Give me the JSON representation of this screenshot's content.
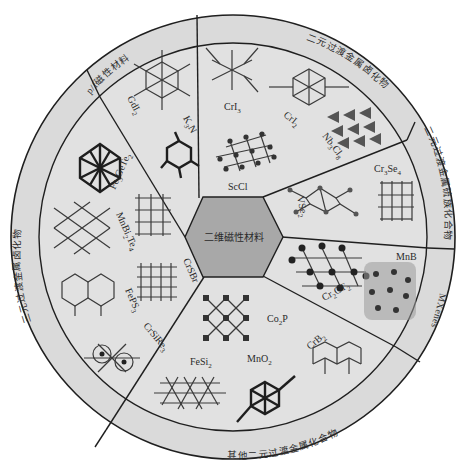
{
  "title": "二维磁性材料",
  "colors": {
    "ring": "#d9d9d9",
    "inner": "#dcdcdc",
    "hexagon": "#a9a9a9",
    "line": "#1f1f1f",
    "background": "#ffffff"
  },
  "categories": [
    {
      "id": "p-orbital",
      "label": "p/f磁性材料"
    },
    {
      "id": "binary-halides",
      "label": "二元过渡金属卤化物"
    },
    {
      "id": "binary-chalcogenides",
      "label": "二元过渡金属硫族化合物"
    },
    {
      "id": "mxenes",
      "label": "MXenes"
    },
    {
      "id": "other-binary",
      "label": "其他二元过渡金属化合物"
    },
    {
      "id": "ternary-halides",
      "label": "三元过渡金属卤化物"
    }
  ],
  "materials": {
    "p_orbital": [
      "GdI2",
      "K3N"
    ],
    "binary_halides": [
      "CrI3",
      "CrI2",
      "Nb3Cl8",
      "ScCl"
    ],
    "binary_chalcogenides": [
      "VSe2",
      "Cr3Se4"
    ],
    "mxenes": [
      "MnB",
      "Cr2CT2"
    ],
    "other_binary": [
      "Co2P",
      "CrB2",
      "MnO2",
      "FeSi2"
    ],
    "ternary_halides": [
      "Fe3GeTe2",
      "MnBi2Te4",
      "CrSBr",
      "FePS3",
      "CrSiRe3"
    ]
  },
  "labels": {
    "GdI2": {
      "base": "GdI",
      "sub": "2"
    },
    "K3N": {
      "base": "K",
      "sub": "3",
      "tail": "N"
    },
    "CrI3": {
      "base": "CrI",
      "sub": "3"
    },
    "CrI2": {
      "base": "CrI",
      "sub": "2"
    },
    "Nb3Cl8": {
      "base": "Nb",
      "sub": "3",
      "tail": "Cl",
      "sub2": "8"
    },
    "ScCl": {
      "base": "ScCl"
    },
    "VSe2": {
      "base": "VSe",
      "sub": "2"
    },
    "Cr3Se4": {
      "base": "Cr",
      "sub": "3",
      "tail": "Se",
      "sub2": "4"
    },
    "MnB": {
      "base": "MnB"
    },
    "Cr2CT2": {
      "base": "Cr",
      "sub": "2",
      "tail": "CT",
      "sub2": "2"
    },
    "Co2P": {
      "base": "Co",
      "sub": "2",
      "tail": "P"
    },
    "CrB2": {
      "base": "CrB",
      "sub": "2"
    },
    "MnO2": {
      "base": "MnO",
      "sub": "2"
    },
    "FeSi2": {
      "base": "FeSi",
      "sub": "2"
    },
    "Fe3GeTe2": {
      "base": "Fe",
      "sub": "3",
      "tail": "GeTe",
      "sub2": "2"
    },
    "MnBi2Te4": {
      "base": "MnBi",
      "sub": "2",
      "tail": "Te",
      "sub2": "4"
    },
    "CrSBr": {
      "base": "CrSBr"
    },
    "FePS3": {
      "base": "FePS",
      "sub": "3"
    },
    "CrSiRe3": {
      "base": "CrSiRe",
      "sub": "3"
    }
  }
}
